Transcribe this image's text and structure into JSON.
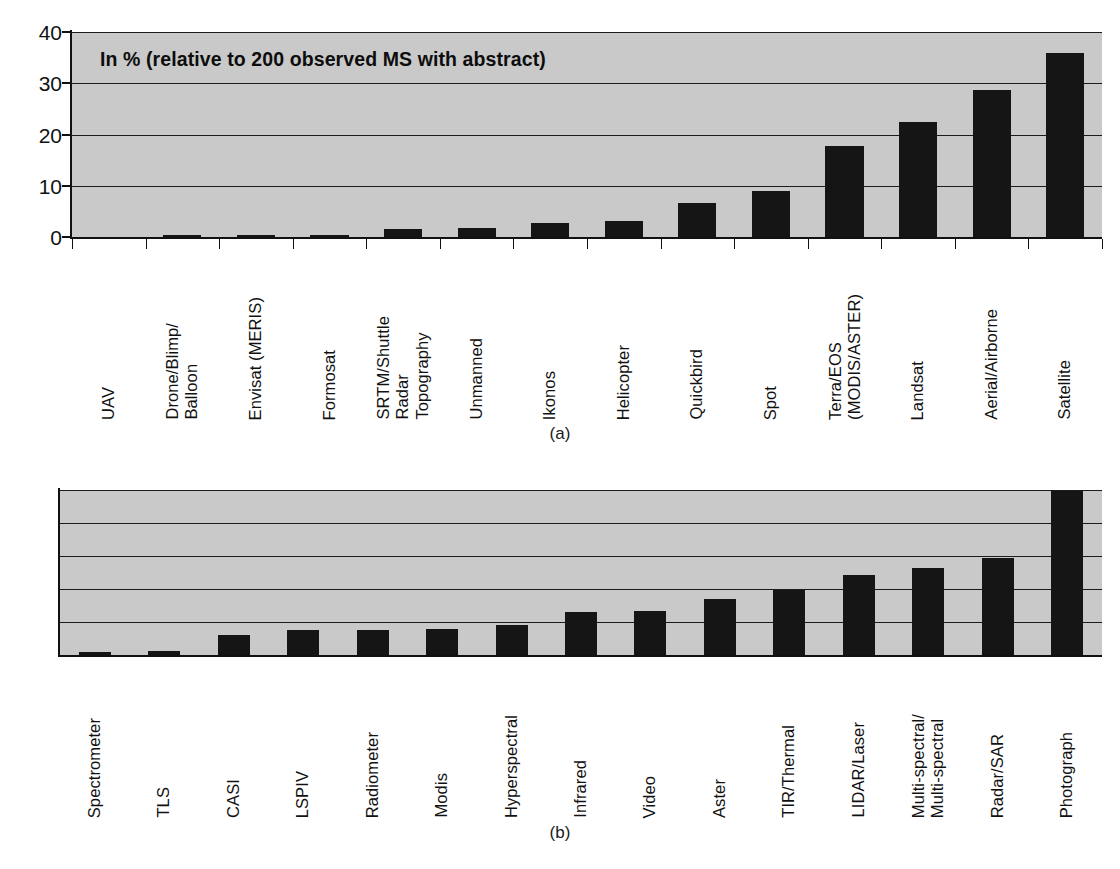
{
  "figure": {
    "panel_a_caption": "(a)",
    "panel_b_caption": "(b)"
  },
  "chart_data": [
    {
      "id": "panel-a",
      "type": "bar",
      "title": "In % (relative to 200 observed MS with abstract)",
      "xlabel": "",
      "ylabel": "",
      "ylim": [
        0,
        40
      ],
      "yticks": [
        0,
        10,
        20,
        30,
        40
      ],
      "grid": true,
      "legend": "none",
      "bar_color": "#151515",
      "plot_bgcolor": "#c9c9c9",
      "categories": [
        "UAV",
        "Drone/Blimp/\nBalloon",
        "Envisat (MERIS)",
        "Formosat",
        "SRTM/Shuttle\nRadar\nTopography",
        "Unmanned",
        "Ikonos",
        "Helicopter",
        "Quickbird",
        "Spot",
        "Terra/EOS\n(MODIS/ASTER)",
        "Landsat",
        "Aerial/Airborne",
        "Satellite"
      ],
      "values": [
        0.1,
        0.4,
        0.4,
        0.4,
        1.5,
        1.7,
        2.8,
        3.2,
        6.6,
        9.0,
        17.8,
        22.4,
        28.7,
        36.0
      ]
    },
    {
      "id": "panel-b",
      "type": "bar",
      "title": "",
      "xlabel": "",
      "ylabel": "",
      "ylim": [
        0,
        25
      ],
      "yticks": [
        0,
        5,
        10,
        15,
        20,
        25
      ],
      "grid": true,
      "legend": "none",
      "bar_color": "#151515",
      "plot_bgcolor": "#c9c9c9",
      "categories": [
        "Spectrometer",
        "TLS",
        "CASI",
        "LSPIV",
        "Radiometer",
        "Modis",
        "Hyperspectral",
        "Infrared",
        "Video",
        "Aster",
        "TIR/Thermal",
        "LIDAR/Laser",
        "Multi-spectral/\nMulti-spectral",
        "Radar/SAR",
        "Photograph"
      ],
      "values": [
        0.5,
        0.6,
        3.1,
        3.8,
        3.85,
        4.0,
        4.6,
        6.5,
        6.7,
        8.5,
        9.9,
        12.1,
        13.2,
        14.7,
        24.8
      ]
    }
  ]
}
